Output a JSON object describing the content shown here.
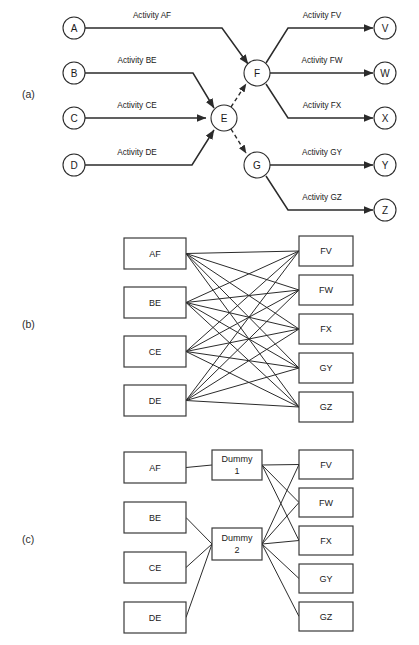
{
  "figure": {
    "background_color": "#ffffff",
    "line_color": "#2b2b2b"
  },
  "panels": {
    "a": {
      "label": "(a)",
      "type": "activity-on-arrow-network",
      "nodes": [
        {
          "id": "A",
          "label": "A",
          "cx": 74,
          "cy": 28,
          "r": 11,
          "role": "start-event"
        },
        {
          "id": "B",
          "label": "B",
          "cx": 74,
          "cy": 73,
          "r": 11,
          "role": "start-event"
        },
        {
          "id": "C",
          "label": "C",
          "cx": 74,
          "cy": 118,
          "r": 11,
          "role": "start-event"
        },
        {
          "id": "D",
          "label": "D",
          "cx": 74,
          "cy": 165,
          "r": 11,
          "role": "start-event"
        },
        {
          "id": "E",
          "label": "E",
          "cx": 224,
          "cy": 118,
          "r": 13,
          "role": "merge-event"
        },
        {
          "id": "F",
          "label": "F",
          "cx": 257,
          "cy": 73,
          "r": 13,
          "role": "burst-event"
        },
        {
          "id": "G",
          "label": "G",
          "cx": 257,
          "cy": 165,
          "r": 13,
          "role": "burst-event"
        },
        {
          "id": "V",
          "label": "V",
          "cx": 385,
          "cy": 28,
          "r": 11,
          "role": "end-event"
        },
        {
          "id": "W",
          "label": "W",
          "cx": 385,
          "cy": 73,
          "r": 11,
          "role": "end-event"
        },
        {
          "id": "X",
          "label": "X",
          "cx": 385,
          "cy": 118,
          "r": 11,
          "role": "end-event"
        },
        {
          "id": "Y",
          "label": "Y",
          "cx": 385,
          "cy": 165,
          "r": 11,
          "role": "end-event"
        },
        {
          "id": "Z",
          "label": "Z",
          "cx": 385,
          "cy": 210,
          "r": 11,
          "role": "end-event"
        }
      ],
      "activities": [
        {
          "id": "AF",
          "label": "Activity AF",
          "from": "A",
          "to": "F",
          "style": "solid",
          "label_x": 152,
          "label_y": 18
        },
        {
          "id": "BE",
          "label": "Activity BE",
          "from": "B",
          "to": "E",
          "style": "solid",
          "label_x": 137,
          "label_y": 63
        },
        {
          "id": "CE",
          "label": "Activity CE",
          "from": "C",
          "to": "E",
          "style": "solid",
          "label_x": 137,
          "label_y": 108
        },
        {
          "id": "DE",
          "label": "Activity DE",
          "from": "D",
          "to": "E",
          "style": "solid",
          "label_x": 137,
          "label_y": 155
        },
        {
          "id": "FV",
          "label": "Activity FV",
          "from": "F",
          "to": "V",
          "style": "solid",
          "label_x": 322,
          "label_y": 18
        },
        {
          "id": "FW",
          "label": "Activity FW",
          "from": "F",
          "to": "W",
          "style": "solid",
          "label_x": 322,
          "label_y": 63
        },
        {
          "id": "FX",
          "label": "Activity FX",
          "from": "F",
          "to": "X",
          "style": "solid",
          "label_x": 322,
          "label_y": 108
        },
        {
          "id": "GY",
          "label": "Activity GY",
          "from": "G",
          "to": "Y",
          "style": "solid",
          "label_x": 322,
          "label_y": 155
        },
        {
          "id": "GZ",
          "label": "Activity GZ",
          "from": "G",
          "to": "Z",
          "style": "solid",
          "label_x": 322,
          "label_y": 200
        }
      ],
      "dummy_activities": [
        {
          "id": "EF",
          "from": "E",
          "to": "F",
          "style": "dashed"
        },
        {
          "id": "EG",
          "from": "E",
          "to": "G",
          "style": "dashed"
        }
      ]
    },
    "b": {
      "label": "(b)",
      "type": "complete-bipartite-precedence-graph",
      "edge_count": 20,
      "left_nodes": [
        {
          "id": "AF",
          "label": "AF",
          "x": 124,
          "y": 238,
          "w": 62,
          "h": 31
        },
        {
          "id": "BE",
          "label": "BE",
          "x": 124,
          "y": 287,
          "w": 62,
          "h": 31
        },
        {
          "id": "CE",
          "label": "CE",
          "x": 124,
          "y": 336,
          "w": 62,
          "h": 31
        },
        {
          "id": "DE",
          "label": "DE",
          "x": 124,
          "y": 385,
          "w": 62,
          "h": 31
        }
      ],
      "right_nodes": [
        {
          "id": "FV",
          "label": "FV",
          "x": 299,
          "y": 236,
          "w": 54,
          "h": 30
        },
        {
          "id": "FW",
          "label": "FW",
          "x": 299,
          "y": 275,
          "w": 54,
          "h": 30
        },
        {
          "id": "FX",
          "label": "FX",
          "x": 299,
          "y": 314,
          "w": 54,
          "h": 30
        },
        {
          "id": "GY",
          "label": "GY",
          "x": 299,
          "y": 353,
          "w": 54,
          "h": 30
        },
        {
          "id": "GZ",
          "label": "GZ",
          "x": 299,
          "y": 392,
          "w": 54,
          "h": 30
        }
      ]
    },
    "c": {
      "label": "(c)",
      "type": "dummy-node-reduced-graph",
      "edge_count": 12,
      "left_nodes": [
        {
          "id": "AF",
          "label": "AF",
          "x": 124,
          "y": 452,
          "w": 62,
          "h": 31
        },
        {
          "id": "BE",
          "label": "BE",
          "x": 124,
          "y": 502,
          "w": 62,
          "h": 31
        },
        {
          "id": "CE",
          "label": "CE",
          "x": 124,
          "y": 552,
          "w": 62,
          "h": 31
        },
        {
          "id": "DE",
          "label": "DE",
          "x": 124,
          "y": 602,
          "w": 62,
          "h": 31
        }
      ],
      "dummy_nodes": [
        {
          "id": "D1",
          "label_line1": "Dummy",
          "label_line2": "1",
          "x": 212,
          "y": 450,
          "w": 50,
          "h": 30
        },
        {
          "id": "D2",
          "label_line1": "Dummy",
          "label_line2": "2",
          "x": 212,
          "y": 528,
          "w": 50,
          "h": 32
        }
      ],
      "right_nodes": [
        {
          "id": "FV",
          "label": "FV",
          "x": 299,
          "y": 450,
          "w": 54,
          "h": 29
        },
        {
          "id": "FW",
          "label": "FW",
          "x": 299,
          "y": 488,
          "w": 54,
          "h": 29
        },
        {
          "id": "FX",
          "label": "FX",
          "x": 299,
          "y": 526,
          "w": 54,
          "h": 29
        },
        {
          "id": "GY",
          "label": "GY",
          "x": 299,
          "y": 564,
          "w": 54,
          "h": 29
        },
        {
          "id": "GZ",
          "label": "GZ",
          "x": 299,
          "y": 602,
          "w": 54,
          "h": 29
        }
      ],
      "edges": [
        {
          "from": "AF",
          "to": "D1"
        },
        {
          "from": "BE",
          "to": "D2"
        },
        {
          "from": "CE",
          "to": "D2"
        },
        {
          "from": "DE",
          "to": "D2"
        },
        {
          "from": "D1",
          "to": "FV"
        },
        {
          "from": "D1",
          "to": "FW"
        },
        {
          "from": "D1",
          "to": "FX"
        },
        {
          "from": "D2",
          "to": "FV"
        },
        {
          "from": "D2",
          "to": "FW"
        },
        {
          "from": "D2",
          "to": "FX"
        },
        {
          "from": "D2",
          "to": "GY"
        },
        {
          "from": "D2",
          "to": "GZ"
        }
      ]
    }
  }
}
